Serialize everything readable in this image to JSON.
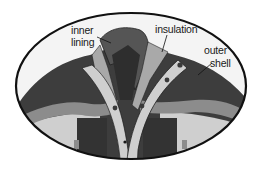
{
  "diagram": {
    "labels": {
      "inner_lining_line1": "inner",
      "inner_lining_line2": "lining",
      "insulation": "insulation",
      "outer_shell_line1": "outer",
      "outer_shell_line2": "shell"
    },
    "colors": {
      "outer_shell": "#3d3d3d",
      "outer_shell_dark": "#2a2a2a",
      "insulation": "#a9a9a9",
      "inner_lining": "#555555",
      "stripe": "#8c8c8c",
      "panel_light": "#cfcfcf",
      "outline": "#111111",
      "background": "#ffffff"
    }
  }
}
